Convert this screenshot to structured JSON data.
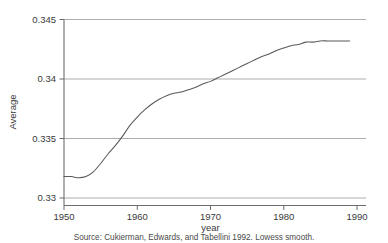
{
  "chart_data": {
    "type": "line",
    "title": "",
    "subtitle": "",
    "xlabel": "year",
    "ylabel": "Average",
    "xlim": [
      1950,
      1990
    ],
    "ylim": [
      0.33,
      0.345
    ],
    "grid": true,
    "legend_position": "none",
    "xticks": [
      1950,
      1960,
      1970,
      1980,
      1990
    ],
    "xtick_labels": [
      "1950",
      "1960",
      "1970",
      "1980",
      "1990"
    ],
    "yticks": [
      0.33,
      0.335,
      0.34,
      0.345
    ],
    "ytick_labels": [
      "0.33",
      "0.335",
      "0.34",
      "0.345"
    ],
    "annotations": [
      "Source: Cukierman, Edwards, and Tabellini 1992. Lowess smooth."
    ],
    "series": [
      {
        "name": "Average",
        "x": [
          1950,
          1951,
          1952,
          1953,
          1954,
          1955,
          1956,
          1957,
          1958,
          1959,
          1960,
          1961,
          1962,
          1963,
          1964,
          1965,
          1966,
          1967,
          1968,
          1969,
          1970,
          1971,
          1972,
          1973,
          1974,
          1975,
          1976,
          1977,
          1978,
          1979,
          1980,
          1981,
          1982,
          1983,
          1984,
          1985,
          1986,
          1987,
          1988,
          1989
        ],
        "values": [
          0.3318,
          0.3318,
          0.3317,
          0.3318,
          0.3322,
          0.3329,
          0.3337,
          0.3344,
          0.3352,
          0.3361,
          0.3368,
          0.3374,
          0.3379,
          0.3383,
          0.3386,
          0.3388,
          0.3389,
          0.3391,
          0.3393,
          0.3396,
          0.3398,
          0.3401,
          0.3404,
          0.3407,
          0.341,
          0.3413,
          0.3416,
          0.3419,
          0.3421,
          0.3424,
          0.3426,
          0.3428,
          0.3429,
          0.3431,
          0.3431,
          0.3432,
          0.3432,
          0.3432,
          0.3432,
          0.3432
        ]
      }
    ]
  },
  "axes": {
    "y_title": "Average",
    "x_title": "year"
  },
  "caption": {
    "text": "Source: Cukierman, Edwards, and Tabellini 1992. Lowess smooth."
  }
}
